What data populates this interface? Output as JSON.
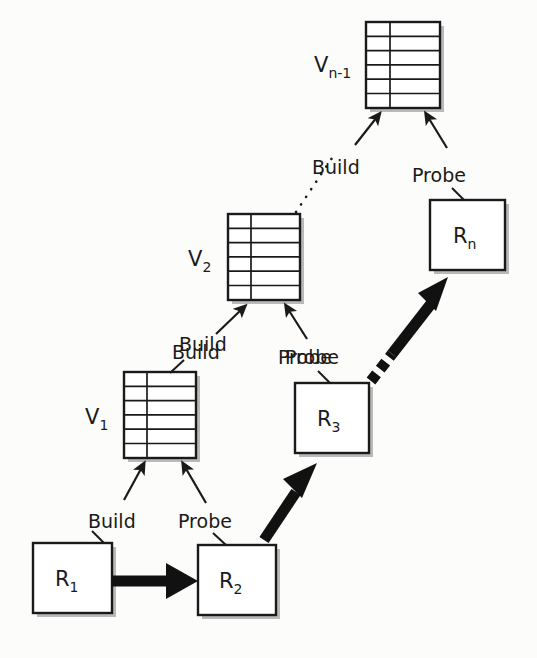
{
  "diagram": {
    "background_color": "#fcfcfb",
    "ink_color": "#1a1a1a",
    "relations": [
      {
        "id": "r1",
        "label": "R",
        "subscript": "1"
      },
      {
        "id": "r2",
        "label": "R",
        "subscript": "2"
      },
      {
        "id": "r3",
        "label": "R",
        "subscript": "3"
      },
      {
        "id": "rn",
        "label": "R",
        "subscript": "n"
      }
    ],
    "hash_tables": [
      {
        "id": "v1",
        "label": "V",
        "subscript": "1",
        "rows": 6,
        "columns": 2
      },
      {
        "id": "v2",
        "label": "V",
        "subscript": "2",
        "rows": 6,
        "columns": 2
      },
      {
        "id": "vn1",
        "label": "V",
        "subscript": "n-1",
        "rows": 6,
        "columns": 2
      }
    ],
    "edge_labels": {
      "build_v1_top": "Build",
      "build_v1_bottom": "Build",
      "probe_v1_bottom": "Probe",
      "build_v2_bottom": "Build",
      "probe_v2_bottom": "Probe",
      "build_vn1": "Build",
      "probe_vn1": "Probe",
      "probe_r3": "Probe"
    }
  }
}
